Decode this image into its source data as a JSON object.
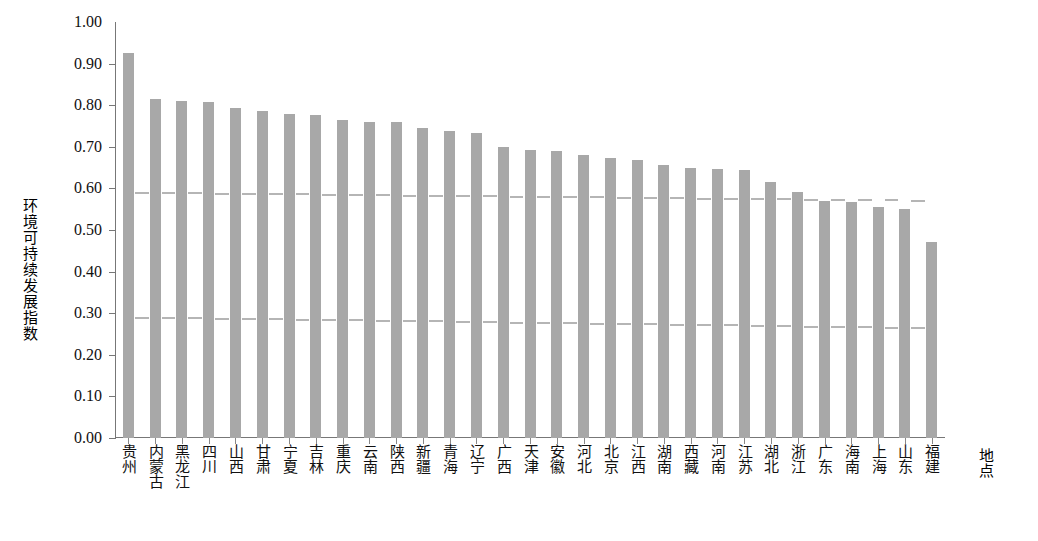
{
  "chart_data": {
    "type": "bar",
    "title": "",
    "subtitle": "",
    "xlabel": "地点",
    "ylabel": "环境可持续发展指数",
    "ylim": [
      0.0,
      1.0
    ],
    "grid": false,
    "legend": null,
    "bar_color": "#a8a8a8",
    "axis_color": "#777777",
    "reference_line_color": "#b5b5b5",
    "categories": [
      "贵州",
      "内蒙古",
      "黑龙江",
      "四川",
      "山西",
      "甘肃",
      "宁夏",
      "吉林",
      "重庆",
      "云南",
      "陕西",
      "新疆",
      "青海",
      "辽宁",
      "广西",
      "天津",
      "安徽",
      "河北",
      "北京",
      "江西",
      "湖南",
      "西藏",
      "河南",
      "江苏",
      "湖北",
      "浙江",
      "广东",
      "海南",
      "上海",
      "山东",
      "福建"
    ],
    "values": [
      0.925,
      0.815,
      0.81,
      0.808,
      0.793,
      0.785,
      0.78,
      0.777,
      0.765,
      0.76,
      0.759,
      0.745,
      0.737,
      0.733,
      0.699,
      0.692,
      0.691,
      0.681,
      0.673,
      0.668,
      0.657,
      0.65,
      0.646,
      0.644,
      0.616,
      0.592,
      0.57,
      0.567,
      0.555,
      0.55,
      0.47
    ],
    "ytick_labels": [
      "1.00",
      "0.90",
      "0.80",
      "0.70",
      "0.60",
      "0.50",
      "0.40",
      "0.30",
      "0.20",
      "0.10",
      "0.00"
    ],
    "ytick_values": [
      1.0,
      0.9,
      0.8,
      0.7,
      0.6,
      0.5,
      0.4,
      0.3,
      0.2,
      0.1,
      0.0
    ],
    "reference_lines": [
      {
        "name": "upper-threshold",
        "start_value": 0.592,
        "end_value": 0.572,
        "style": "dashed"
      },
      {
        "name": "lower-threshold",
        "start_value": 0.292,
        "end_value": 0.266,
        "style": "dashed"
      }
    ]
  }
}
